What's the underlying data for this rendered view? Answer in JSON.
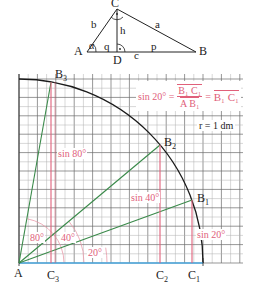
{
  "triangle": {
    "vertices": {
      "A": "A",
      "B": "B",
      "C": "C",
      "D": "D"
    },
    "sides": {
      "a": "a",
      "b": "b",
      "c": "c",
      "h": "h",
      "p": "p",
      "q": "q"
    },
    "angle": "α"
  },
  "diagram": {
    "formula": {
      "lhs": "sin 20° =",
      "num": "B₁ C₁",
      "den": "A B₁",
      "eq": "=",
      "rhs": "B₁ C₁"
    },
    "radius_label": "r = 1 dm",
    "points": {
      "A": "A",
      "B1": "B",
      "B1_sub": "1",
      "B2": "B",
      "B2_sub": "2",
      "B3": "B",
      "B3_sub": "3",
      "C1": "C",
      "C1_sub": "1",
      "C2": "C",
      "C2_sub": "2",
      "C3": "C",
      "C3_sub": "3"
    },
    "sine_labels": {
      "s80": "sin 80°",
      "s40": "sin 40°",
      "s20": "sin 20°"
    },
    "angle_labels": {
      "a80": "80°",
      "a40": "40°",
      "a20": "20°"
    },
    "angles_deg": [
      20,
      40,
      80
    ],
    "colors": {
      "grid": "#555555",
      "arc": "#1a1a1a",
      "ray": "#3a8a4a",
      "sine": "#e0607a",
      "axis": "#4aa8e0",
      "text": "#222222"
    }
  }
}
